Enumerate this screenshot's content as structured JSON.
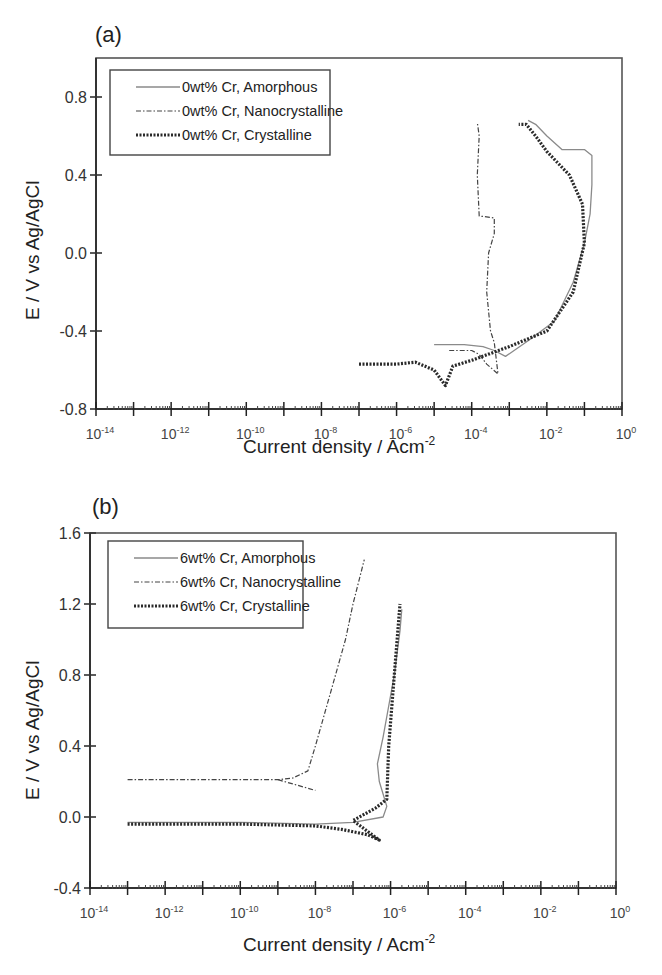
{
  "figure": {
    "panels": [
      {
        "id": "a",
        "panel_label": "(a)",
        "ylabel": "E / V vs Ag/AgCl",
        "xlabel_main": "Current density / Acm",
        "xlabel_sup": "-2",
        "yticks": [
          "0.8",
          "0.4",
          "0.0",
          "-0.4",
          "-0.8"
        ],
        "xticks": [
          {
            "base": "10",
            "exp": "-14"
          },
          {
            "base": "10",
            "exp": "-12"
          },
          {
            "base": "10",
            "exp": "-10"
          },
          {
            "base": "10",
            "exp": "-8"
          },
          {
            "base": "10",
            "exp": "-6"
          },
          {
            "base": "10",
            "exp": "-4"
          },
          {
            "base": "10",
            "exp": "-2"
          },
          {
            "base": "10",
            "exp": "0"
          }
        ],
        "legend": [
          "0wt% Cr, Amorphous",
          "0wt% Cr, Nanocrystalline",
          "0wt% Cr, Crystalline"
        ]
      },
      {
        "id": "b",
        "panel_label": "(b)",
        "ylabel": "E / V vs Ag/AgCl",
        "xlabel_main": "Current density / Acm",
        "xlabel_sup": "-2",
        "yticks": [
          "1.6",
          "1.2",
          "0.8",
          "0.4",
          "0.0",
          "-0.4"
        ],
        "xticks": [
          {
            "base": "10",
            "exp": "-14"
          },
          {
            "base": "10",
            "exp": "-12"
          },
          {
            "base": "10",
            "exp": "-10"
          },
          {
            "base": "10",
            "exp": "-8"
          },
          {
            "base": "10",
            "exp": "-6"
          },
          {
            "base": "10",
            "exp": "-4"
          },
          {
            "base": "10",
            "exp": "-2"
          },
          {
            "base": "10",
            "exp": "0"
          }
        ],
        "legend": [
          "6wt% Cr, Amorphous",
          "6wt% Cr, Nanocrystalline",
          "6wt% Cr, Crystalline"
        ]
      }
    ]
  },
  "chart_data": [
    {
      "type": "line",
      "title": "(a)",
      "xlabel": "Current density / Acm-2",
      "ylabel": "E / V vs Ag/AgCl",
      "xscale": "log",
      "xlim_log10": [
        -14,
        0
      ],
      "ylim": [
        -0.8,
        1.0
      ],
      "yticks": [
        -0.8,
        -0.4,
        0.0,
        0.4,
        0.8
      ],
      "xticks_log10": [
        -14,
        -12,
        -10,
        -8,
        -6,
        -4,
        -2,
        0
      ],
      "grid": false,
      "legend_position": "upper left",
      "series": [
        {
          "name": "0wt% Cr, Amorphous",
          "style": "solid-light",
          "points_log10x_y": [
            [
              -5.0,
              -0.47
            ],
            [
              -4.2,
              -0.47
            ],
            [
              -3.7,
              -0.48
            ],
            [
              -3.4,
              -0.5
            ],
            [
              -3.1,
              -0.53
            ],
            [
              -2.5,
              -0.45
            ],
            [
              -1.8,
              -0.35
            ],
            [
              -1.3,
              -0.15
            ],
            [
              -1.0,
              0.05
            ],
            [
              -0.85,
              0.2
            ],
            [
              -0.8,
              0.35
            ],
            [
              -0.8,
              0.5
            ],
            [
              -1.0,
              0.53
            ],
            [
              -1.6,
              0.53
            ],
            [
              -2.0,
              0.6
            ],
            [
              -2.3,
              0.66
            ],
            [
              -2.5,
              0.68
            ]
          ]
        },
        {
          "name": "0wt% Cr, Nanocrystalline",
          "style": "dash-dot",
          "points_log10x_y": [
            [
              -4.6,
              -0.5
            ],
            [
              -4.0,
              -0.5
            ],
            [
              -3.8,
              -0.52
            ],
            [
              -3.6,
              -0.57
            ],
            [
              -3.3,
              -0.62
            ],
            [
              -3.4,
              -0.46
            ],
            [
              -3.5,
              -0.4
            ],
            [
              -3.6,
              -0.2
            ],
            [
              -3.55,
              0.0
            ],
            [
              -3.4,
              0.1
            ],
            [
              -3.4,
              0.18
            ],
            [
              -3.8,
              0.19
            ],
            [
              -3.85,
              0.4
            ],
            [
              -3.8,
              0.6
            ],
            [
              -3.85,
              0.67
            ]
          ]
        },
        {
          "name": "0wt% Cr, Crystalline",
          "style": "dotted-heavy",
          "points_log10x_y": [
            [
              -7.0,
              -0.57
            ],
            [
              -6.0,
              -0.57
            ],
            [
              -5.5,
              -0.56
            ],
            [
              -5.0,
              -0.6
            ],
            [
              -4.7,
              -0.68
            ],
            [
              -4.5,
              -0.58
            ],
            [
              -4.0,
              -0.55
            ],
            [
              -3.0,
              -0.48
            ],
            [
              -2.0,
              -0.4
            ],
            [
              -1.3,
              -0.2
            ],
            [
              -1.0,
              0.05
            ],
            [
              -1.05,
              0.25
            ],
            [
              -1.4,
              0.4
            ],
            [
              -2.0,
              0.52
            ],
            [
              -2.3,
              0.6
            ],
            [
              -2.55,
              0.66
            ],
            [
              -2.75,
              0.66
            ]
          ]
        }
      ]
    },
    {
      "type": "line",
      "title": "(b)",
      "xlabel": "Current density / Acm-2",
      "ylabel": "E / V vs Ag/AgCl",
      "xscale": "log",
      "xlim_log10": [
        -14,
        0
      ],
      "ylim": [
        -0.4,
        1.6
      ],
      "yticks": [
        -0.4,
        0.0,
        0.4,
        0.8,
        1.2,
        1.6
      ],
      "xticks_log10": [
        -14,
        -12,
        -10,
        -8,
        -6,
        -4,
        -2,
        0
      ],
      "grid": false,
      "legend_position": "upper left",
      "series": [
        {
          "name": "6wt% Cr, Amorphous",
          "style": "solid-light",
          "points_log10x_y": [
            [
              -13.0,
              -0.03
            ],
            [
              -10.0,
              -0.03
            ],
            [
              -8.0,
              -0.04
            ],
            [
              -7.0,
              -0.03
            ],
            [
              -6.2,
              0.0
            ],
            [
              -6.1,
              0.06
            ],
            [
              -6.3,
              0.2
            ],
            [
              -6.35,
              0.3
            ],
            [
              -6.2,
              0.45
            ],
            [
              -5.9,
              0.8
            ],
            [
              -5.75,
              1.05
            ],
            [
              -5.7,
              1.17
            ]
          ]
        },
        {
          "name": "6wt% Cr, Nanocrystalline",
          "style": "dash-dot",
          "points_log10x_y": [
            [
              -13.0,
              0.21
            ],
            [
              -10.0,
              0.21
            ],
            [
              -9.0,
              0.21
            ],
            [
              -8.6,
              0.22
            ],
            [
              -8.2,
              0.26
            ],
            [
              -8.0,
              0.4
            ],
            [
              -7.6,
              0.7
            ],
            [
              -7.2,
              1.0
            ],
            [
              -7.0,
              1.2
            ],
            [
              -6.7,
              1.45
            ]
          ],
          "branch_points_log10x_y": [
            [
              -9.0,
              0.21
            ],
            [
              -8.5,
              0.18
            ],
            [
              -8.0,
              0.15
            ]
          ]
        },
        {
          "name": "6wt% Cr, Crystalline",
          "style": "dotted-heavy",
          "points_log10x_y": [
            [
              -13.0,
              -0.04
            ],
            [
              -10.0,
              -0.04
            ],
            [
              -8.0,
              -0.05
            ],
            [
              -7.3,
              -0.07
            ],
            [
              -6.6,
              -0.1
            ],
            [
              -6.3,
              -0.13
            ],
            [
              -7.0,
              -0.02
            ],
            [
              -6.4,
              0.05
            ],
            [
              -6.1,
              0.1
            ],
            [
              -6.05,
              0.4
            ],
            [
              -5.9,
              0.8
            ],
            [
              -5.75,
              1.2
            ]
          ]
        }
      ]
    }
  ]
}
